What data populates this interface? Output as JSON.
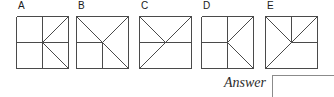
{
  "puzzle": {
    "type": "visual-reasoning-multiple-choice",
    "options": [
      {
        "label": "A",
        "x": 16,
        "figure_name": "option-figure-a",
        "lines": [
          {
            "name": "square-border",
            "x1": 0,
            "y1": 0,
            "x2": 52,
            "y2": 0
          },
          {
            "name": "square-border",
            "x1": 52,
            "y1": 0,
            "x2": 52,
            "y2": 52
          },
          {
            "name": "square-border",
            "x1": 52,
            "y1": 52,
            "x2": 0,
            "y2": 52
          },
          {
            "name": "square-border",
            "x1": 0,
            "y1": 52,
            "x2": 0,
            "y2": 0
          },
          {
            "name": "vertical-center-full",
            "x1": 26,
            "y1": 0,
            "x2": 26,
            "y2": 52
          },
          {
            "name": "horizontal-center-full",
            "x1": 0,
            "y1": 26,
            "x2": 52,
            "y2": 26
          },
          {
            "name": "diagonal-center-to-top-right",
            "x1": 26,
            "y1": 26,
            "x2": 52,
            "y2": 0
          },
          {
            "name": "diagonal-center-to-bottom-right",
            "x1": 26,
            "y1": 26,
            "x2": 52,
            "y2": 52
          }
        ]
      },
      {
        "label": "B",
        "x": 76,
        "figure_name": "option-figure-b",
        "lines": [
          {
            "name": "square-border",
            "x1": 0,
            "y1": 0,
            "x2": 52,
            "y2": 0
          },
          {
            "name": "square-border",
            "x1": 52,
            "y1": 0,
            "x2": 52,
            "y2": 52
          },
          {
            "name": "square-border",
            "x1": 52,
            "y1": 52,
            "x2": 0,
            "y2": 52
          },
          {
            "name": "square-border",
            "x1": 0,
            "y1": 52,
            "x2": 0,
            "y2": 0
          },
          {
            "name": "diagonal-top-left-to-bottom-right",
            "x1": 0,
            "y1": 0,
            "x2": 52,
            "y2": 52
          },
          {
            "name": "diagonal-top-right-to-center",
            "x1": 52,
            "y1": 0,
            "x2": 26,
            "y2": 26
          },
          {
            "name": "horizontal-left-half",
            "x1": 0,
            "y1": 26,
            "x2": 26,
            "y2": 26
          },
          {
            "name": "vertical-bottom-half",
            "x1": 26,
            "y1": 26,
            "x2": 26,
            "y2": 52
          }
        ]
      },
      {
        "label": "C",
        "x": 139,
        "figure_name": "option-figure-c",
        "lines": [
          {
            "name": "square-border",
            "x1": 0,
            "y1": 0,
            "x2": 52,
            "y2": 0
          },
          {
            "name": "square-border",
            "x1": 52,
            "y1": 0,
            "x2": 52,
            "y2": 52
          },
          {
            "name": "square-border",
            "x1": 52,
            "y1": 52,
            "x2": 0,
            "y2": 52
          },
          {
            "name": "square-border",
            "x1": 0,
            "y1": 52,
            "x2": 0,
            "y2": 0
          },
          {
            "name": "horizontal-center-full",
            "x1": 0,
            "y1": 26,
            "x2": 52,
            "y2": 26
          },
          {
            "name": "diagonal-bottom-left-to-top-right",
            "x1": 0,
            "y1": 52,
            "x2": 52,
            "y2": 0
          },
          {
            "name": "diagonal-top-left-to-center",
            "x1": 0,
            "y1": 0,
            "x2": 26,
            "y2": 26
          }
        ]
      },
      {
        "label": "D",
        "x": 201,
        "figure_name": "option-figure-d",
        "lines": [
          {
            "name": "square-border",
            "x1": 0,
            "y1": 0,
            "x2": 52,
            "y2": 0
          },
          {
            "name": "square-border",
            "x1": 52,
            "y1": 0,
            "x2": 52,
            "y2": 52
          },
          {
            "name": "square-border",
            "x1": 52,
            "y1": 52,
            "x2": 0,
            "y2": 52
          },
          {
            "name": "square-border",
            "x1": 0,
            "y1": 52,
            "x2": 0,
            "y2": 0
          },
          {
            "name": "vertical-center-full",
            "x1": 26,
            "y1": 0,
            "x2": 26,
            "y2": 52
          },
          {
            "name": "horizontal-left-half",
            "x1": 0,
            "y1": 26,
            "x2": 26,
            "y2": 26
          },
          {
            "name": "diagonal-center-to-top-right",
            "x1": 26,
            "y1": 26,
            "x2": 52,
            "y2": 0
          },
          {
            "name": "diagonal-center-to-bottom-right",
            "x1": 26,
            "y1": 26,
            "x2": 52,
            "y2": 52
          }
        ]
      },
      {
        "label": "E",
        "x": 265,
        "figure_name": "option-figure-e",
        "lines": [
          {
            "name": "square-border",
            "x1": 0,
            "y1": 0,
            "x2": 52,
            "y2": 0
          },
          {
            "name": "square-border",
            "x1": 52,
            "y1": 0,
            "x2": 52,
            "y2": 52
          },
          {
            "name": "square-border",
            "x1": 52,
            "y1": 52,
            "x2": 0,
            "y2": 52
          },
          {
            "name": "square-border",
            "x1": 0,
            "y1": 52,
            "x2": 0,
            "y2": 0
          },
          {
            "name": "vertical-top-half",
            "x1": 26,
            "y1": 0,
            "x2": 26,
            "y2": 26
          },
          {
            "name": "horizontal-right-half",
            "x1": 26,
            "y1": 26,
            "x2": 52,
            "y2": 26
          },
          {
            "name": "diagonal-bottom-left-to-top-right",
            "x1": 0,
            "y1": 52,
            "x2": 52,
            "y2": 0
          },
          {
            "name": "diagonal-top-left-to-center",
            "x1": 0,
            "y1": 0,
            "x2": 26,
            "y2": 26
          }
        ]
      }
    ]
  },
  "answer": {
    "label": "Answer",
    "value": "",
    "placeholder": ""
  },
  "style": {
    "line_color": "#4a4a4a",
    "border_color": "#8b8b8b",
    "background": "#ffffff",
    "text_color": "#1a1a1a"
  }
}
